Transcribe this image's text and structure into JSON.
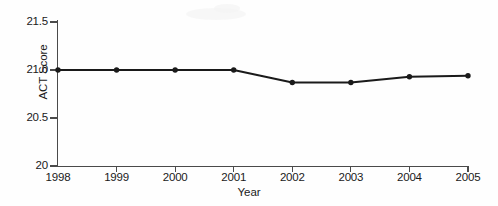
{
  "chart_data": {
    "type": "line",
    "title": "",
    "xlabel": "Year",
    "ylabel": "ACT Score",
    "categories": [
      "1998",
      "1999",
      "2000",
      "2001",
      "2002",
      "2003",
      "2004",
      "2005"
    ],
    "x": [
      1998,
      1999,
      2000,
      2001,
      2002,
      2003,
      2004,
      2005
    ],
    "values": [
      21.0,
      21.0,
      21.0,
      21.0,
      20.87,
      20.87,
      20.93,
      20.94
    ],
    "series": [
      {
        "name": "ACT Score",
        "values": [
          21.0,
          21.0,
          21.0,
          21.0,
          20.87,
          20.87,
          20.93,
          20.94
        ]
      }
    ],
    "ylim": [
      20,
      21.5
    ],
    "xlim": [
      1998,
      2005
    ],
    "ytick_labels": [
      "21.5",
      "21.0",
      "20.5",
      "20"
    ],
    "ytick_values": [
      21.5,
      21.0,
      20.5,
      20.0
    ],
    "xtick_labels": [
      "1998",
      "1999",
      "2000",
      "2001",
      "2002",
      "2003",
      "2004",
      "2005"
    ],
    "grid": false,
    "legend": false,
    "legend_position": "none",
    "marker": "filled-circle",
    "line_color": "#1a1a1a",
    "marker_color": "#1a1a1a",
    "background_color": "#fefefe",
    "axis_color": "#4a4a4a"
  }
}
